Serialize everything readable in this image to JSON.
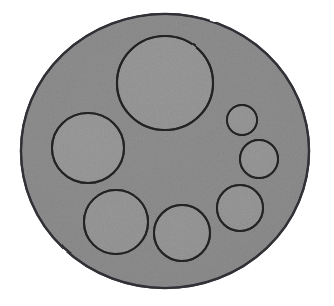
{
  "figure": {
    "kind": "scanned-grayscale-figure",
    "canvas": {
      "width": 334,
      "height": 306
    },
    "background_color": "#ffffff",
    "disc_fill_color": "#9a9a9a",
    "inner_fill_color": "#a6a6a6",
    "outline_color": "#2b2b2b",
    "texture": "scan-grain",
    "outer_disc": {
      "name": "outer-disc",
      "cx": 165,
      "cy": 151,
      "rx": 144,
      "ry": 137,
      "rotation": -3,
      "stroke_width": 2.4,
      "fill": "#9a9a9a"
    },
    "inner_circles": [
      {
        "name": "circle-top-large",
        "label": "1",
        "cx": 165,
        "cy": 83,
        "rx": 48,
        "ry": 47,
        "rotation": 0,
        "stroke_width": 2.2,
        "fill": "#a6a6a6"
      },
      {
        "name": "circle-left-middle",
        "label": "2",
        "cx": 88,
        "cy": 148,
        "rx": 36,
        "ry": 35,
        "rotation": 0,
        "stroke_width": 2.1,
        "fill": "#a6a6a6"
      },
      {
        "name": "circle-bottom-left",
        "label": "3",
        "cx": 116,
        "cy": 222,
        "rx": 32,
        "ry": 32,
        "rotation": 0,
        "stroke_width": 2.1,
        "fill": "#a6a6a6"
      },
      {
        "name": "circle-bottom-center",
        "label": "4",
        "cx": 182,
        "cy": 233,
        "rx": 28,
        "ry": 28,
        "rotation": 0,
        "stroke_width": 2.1,
        "fill": "#a6a6a6"
      },
      {
        "name": "circle-right-lower",
        "label": "5",
        "cx": 240,
        "cy": 208,
        "rx": 23,
        "ry": 23,
        "rotation": 0,
        "stroke_width": 2.0,
        "fill": "#a6a6a6"
      },
      {
        "name": "circle-right-middle",
        "label": "6",
        "cx": 259,
        "cy": 159,
        "rx": 19,
        "ry": 19,
        "rotation": 0,
        "stroke_width": 2.0,
        "fill": "#a6a6a6"
      },
      {
        "name": "circle-right-small",
        "label": "7",
        "cx": 242,
        "cy": 120,
        "rx": 15,
        "ry": 15,
        "rotation": 0,
        "stroke_width": 1.9,
        "fill": "#a6a6a6"
      }
    ],
    "counts": {
      "inner_circle_count": 7,
      "outer_disc_count": 1
    }
  }
}
